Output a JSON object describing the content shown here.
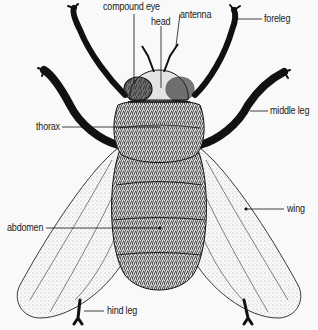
{
  "diagram": {
    "labels": {
      "compound_eye": "compound eye",
      "head": "head",
      "antenna": "antenna",
      "foreleg": "foreleg",
      "middle_leg": "middle leg",
      "thorax": "thorax",
      "wing": "wing",
      "abdomen": "abdomen",
      "hind_leg": "hind leg"
    },
    "colors": {
      "background": "#f9f9f9",
      "ink": "#1a1a1a",
      "label_text": "#222222"
    }
  }
}
